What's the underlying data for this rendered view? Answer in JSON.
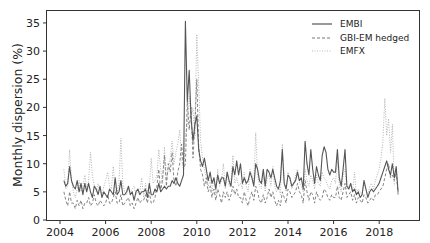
{
  "chart_data": {
    "type": "line",
    "title": "",
    "xlabel": "",
    "ylabel": "Monthly dispersion (%)",
    "xlim": [
      2003.6,
      2019.8
    ],
    "ylim": [
      0,
      36.5
    ],
    "xticks": [
      2004,
      2006,
      2008,
      2010,
      2012,
      2014,
      2016,
      2018
    ],
    "xtick_labels": [
      "2004",
      "2006",
      "2008",
      "2010",
      "2012",
      "2014",
      "2016",
      "2018"
    ],
    "yticks": [
      0,
      5,
      10,
      15,
      20,
      25,
      30,
      35
    ],
    "ytick_labels": [
      "0",
      "5",
      "10",
      "15",
      "20",
      "25",
      "30",
      "35"
    ],
    "grid": false,
    "legend_position": "upper right",
    "x_start": 2004.17,
    "x_step": 0.0833,
    "series": [
      {
        "name": "EMBI",
        "style": "solid",
        "color": "#555555",
        "values": [
          7.0,
          6.0,
          6.5,
          9.5,
          7.0,
          6.0,
          5.5,
          7.0,
          5.0,
          6.5,
          4.5,
          6.5,
          5.0,
          6.5,
          5.0,
          4.0,
          6.0,
          5.5,
          4.5,
          6.0,
          4.0,
          5.0,
          4.5,
          4.0,
          5.5,
          5.0,
          4.5,
          7.5,
          4.5,
          5.0,
          7.0,
          4.5,
          4.5,
          5.0,
          6.0,
          4.5,
          5.0,
          3.5,
          5.0,
          5.5,
          4.5,
          5.0,
          5.0,
          5.5,
          4.0,
          6.5,
          4.5,
          4.5,
          5.5,
          5.0,
          6.5,
          5.0,
          5.5,
          6.0,
          5.5,
          6.0,
          6.0,
          7.0,
          6.5,
          7.5,
          6.5,
          6.0,
          7.0,
          8.0,
          35.3,
          21.0,
          26.6,
          18.0,
          14.0,
          17.0,
          18.5,
          12.5,
          10.5,
          9.5,
          11.0,
          9.0,
          7.0,
          8.5,
          6.5,
          7.5,
          5.5,
          8.0,
          6.5,
          7.5,
          7.5,
          6.0,
          8.5,
          7.0,
          6.0,
          9.5,
          8.0,
          10.5,
          8.0,
          10.0,
          6.5,
          7.5,
          6.5,
          7.0,
          8.5,
          7.5,
          6.0,
          10.0,
          9.0,
          7.0,
          6.5,
          9.0,
          6.0,
          9.0,
          8.5,
          7.5,
          9.0,
          7.5,
          6.0,
          5.5,
          7.0,
          12.5,
          6.5,
          5.5,
          8.0,
          7.5,
          6.0,
          6.5,
          7.0,
          8.5,
          7.0,
          7.5,
          5.5,
          14.0,
          10.0,
          8.0,
          12.5,
          9.0,
          6.5,
          9.5,
          8.0,
          7.0,
          11.5,
          13.0,
          12.0,
          9.0,
          8.0,
          9.0,
          8.5,
          8.5,
          12.5,
          7.5,
          6.0,
          9.0,
          12.5,
          6.0,
          5.5,
          6.5,
          5.0,
          5.5,
          4.5,
          5.0,
          4.0,
          4.5,
          7.0,
          5.5,
          4.0,
          5.0,
          5.5,
          5.0,
          5.5,
          6.0,
          6.5,
          7.5,
          8.5,
          9.5,
          10.5,
          9.0,
          8.0,
          10.0,
          7.5,
          9.5,
          5.0
        ]
      },
      {
        "name": "GBI-EM hedged",
        "style": "dashed",
        "color": "#777777",
        "values": [
          5.0,
          3.5,
          2.5,
          5.0,
          3.0,
          3.0,
          2.0,
          3.5,
          2.5,
          3.5,
          2.0,
          3.0,
          3.0,
          4.0,
          2.5,
          3.0,
          4.5,
          3.0,
          2.5,
          3.5,
          3.0,
          2.5,
          3.0,
          4.5,
          3.0,
          3.0,
          4.0,
          5.0,
          3.0,
          3.0,
          4.5,
          2.5,
          3.0,
          3.5,
          4.0,
          2.5,
          3.0,
          2.0,
          3.0,
          4.0,
          3.0,
          3.5,
          3.5,
          4.5,
          3.0,
          5.0,
          3.0,
          3.0,
          4.0,
          6.0,
          9.0,
          5.0,
          7.5,
          11.5,
          6.0,
          10.0,
          8.5,
          12.0,
          7.0,
          6.0,
          8.5,
          10.0,
          13.5,
          9.0,
          10.0,
          21.0,
          16.0,
          20.0,
          11.0,
          17.0,
          25.0,
          13.0,
          9.0,
          8.0,
          6.0,
          7.5,
          5.0,
          6.0,
          4.0,
          5.5,
          3.5,
          5.5,
          4.5,
          3.0,
          5.0,
          4.0,
          5.0,
          3.5,
          4.5,
          6.0,
          4.5,
          5.5,
          4.0,
          4.0,
          3.0,
          5.0,
          3.5,
          2.5,
          4.0,
          5.0,
          3.5,
          6.0,
          5.0,
          3.5,
          3.0,
          4.5,
          3.0,
          4.0,
          5.5,
          4.0,
          5.0,
          3.5,
          2.5,
          3.5,
          2.5,
          5.0,
          4.0,
          3.0,
          5.5,
          5.0,
          4.0,
          4.5,
          5.0,
          6.5,
          5.0,
          4.5,
          3.0,
          7.0,
          5.0,
          3.5,
          5.0,
          4.5,
          3.0,
          5.0,
          4.0,
          3.5,
          4.0,
          5.5,
          5.0,
          4.0,
          3.5,
          4.5,
          4.0,
          4.0,
          6.0,
          4.0,
          3.5,
          5.0,
          6.5,
          4.0,
          4.5,
          5.0,
          3.5,
          4.5,
          3.0,
          4.0,
          3.5,
          3.0,
          4.5,
          4.0,
          3.0,
          3.5,
          4.0,
          3.5,
          4.5,
          4.5,
          5.0,
          5.5,
          6.0,
          7.5,
          9.0,
          10.0,
          7.5,
          8.0,
          7.0,
          8.5,
          4.5
        ]
      },
      {
        "name": "EMFX",
        "style": "dotted",
        "color": "#aaaaaa",
        "values": [
          9.0,
          5.5,
          6.0,
          12.5,
          7.0,
          5.0,
          4.0,
          5.5,
          7.0,
          5.0,
          6.0,
          8.0,
          5.5,
          7.0,
          12.0,
          8.0,
          6.0,
          5.0,
          6.5,
          5.0,
          4.5,
          6.0,
          7.0,
          8.5,
          6.0,
          5.5,
          9.5,
          5.0,
          5.0,
          6.5,
          14.5,
          6.5,
          5.0,
          4.5,
          5.5,
          5.0,
          5.5,
          6.0,
          4.5,
          5.0,
          5.0,
          7.5,
          4.0,
          6.5,
          5.0,
          5.5,
          11.0,
          6.5,
          7.0,
          8.0,
          12.5,
          9.0,
          6.5,
          13.0,
          7.0,
          9.0,
          11.0,
          14.0,
          10.0,
          12.0,
          13.5,
          16.0,
          11.0,
          9.0,
          15.0,
          17.0,
          22.0,
          18.0,
          20.0,
          15.0,
          33.0,
          24.0,
          14.0,
          11.0,
          9.0,
          7.5,
          6.0,
          7.0,
          5.0,
          7.5,
          4.5,
          9.0,
          6.0,
          7.0,
          10.0,
          5.5,
          8.5,
          6.0,
          7.0,
          11.5,
          6.5,
          7.5,
          6.0,
          6.5,
          5.5,
          8.5,
          6.0,
          5.0,
          9.0,
          8.0,
          6.5,
          15.5,
          8.0,
          6.0,
          5.5,
          8.0,
          5.0,
          7.5,
          8.0,
          6.0,
          9.5,
          6.0,
          5.0,
          6.0,
          4.5,
          13.5,
          7.0,
          5.0,
          8.5,
          7.0,
          5.5,
          6.5,
          8.0,
          9.0,
          6.5,
          6.0,
          5.0,
          9.0,
          7.0,
          6.0,
          8.0,
          7.0,
          5.5,
          8.0,
          6.5,
          6.0,
          8.5,
          7.5,
          7.0,
          6.0,
          5.5,
          7.0,
          7.5,
          6.5,
          11.0,
          6.0,
          5.0,
          8.0,
          9.0,
          5.5,
          6.0,
          6.5,
          5.0,
          8.5,
          4.5,
          5.5,
          5.0,
          4.5,
          7.0,
          5.5,
          4.5,
          6.0,
          6.5,
          5.5,
          7.0,
          8.0,
          9.0,
          11.0,
          14.0,
          21.6,
          15.0,
          18.0,
          12.0,
          17.0,
          6.0
        ]
      }
    ]
  },
  "legend": {
    "items": [
      {
        "label": "EMBI"
      },
      {
        "label": "GBI-EM hedged"
      },
      {
        "label": "EMFX"
      }
    ]
  },
  "axes": {
    "ylabel": "Monthly dispersion (%)"
  }
}
